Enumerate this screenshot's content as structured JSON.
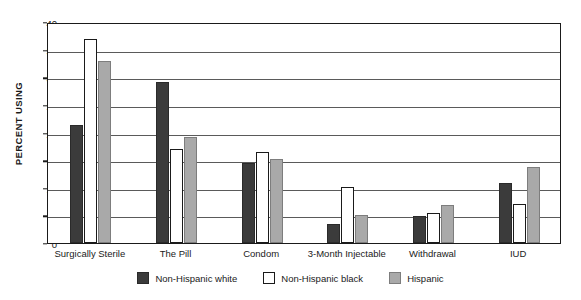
{
  "chart_data": {
    "type": "bar",
    "title": "",
    "xlabel": "",
    "ylabel": "PERCENT USING",
    "ylim": [
      0,
      40
    ],
    "yticks": [
      0,
      5,
      10,
      15,
      20,
      25,
      30,
      35,
      40
    ],
    "ytick_labels": [
      "0",
      "5",
      "10",
      "15",
      "20",
      "25",
      "30",
      "35",
      "40"
    ],
    "grid": true,
    "legend_position": "bottom",
    "categories": [
      "Surgically Sterile",
      "The Pill",
      "Condom",
      "3-Month Injectable",
      "Withdrawal",
      "IUD"
    ],
    "series": [
      {
        "name": "Non-Hispanic white",
        "color": "#3b3b3b",
        "values": [
          21.4,
          29.2,
          14.5,
          3.4,
          4.9,
          10.9
        ]
      },
      {
        "name": "Non-Hispanic black",
        "color": "#ffffff",
        "values": [
          36.9,
          17.1,
          16.5,
          10.2,
          5.4,
          7.0
        ]
      },
      {
        "name": "Hispanic",
        "color": "#a9a9a9",
        "values": [
          32.9,
          19.2,
          15.2,
          5.0,
          6.9,
          13.7
        ]
      }
    ]
  },
  "legend": {
    "items": [
      {
        "label": "Non-Hispanic white"
      },
      {
        "label": "Non-Hispanic black"
      },
      {
        "label": "Hispanic"
      }
    ]
  }
}
